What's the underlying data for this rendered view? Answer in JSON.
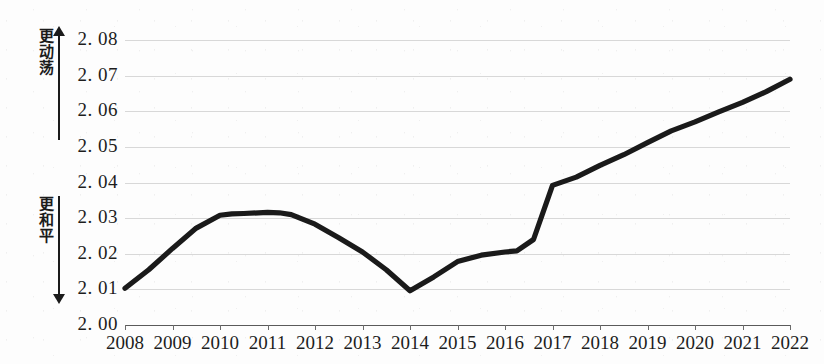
{
  "axes": {
    "y": {
      "direction_top_label": "更动荡",
      "direction_bottom_label": "更和平",
      "tick_labels": [
        "2. 08",
        "2. 07",
        "2. 06",
        "2. 05",
        "2. 04",
        "2. 03",
        "2. 02",
        "2. 01",
        "2. 00"
      ],
      "tick_values": [
        2.08,
        2.07,
        2.06,
        2.05,
        2.04,
        2.03,
        2.02,
        2.01,
        2.0
      ]
    },
    "x": {
      "tick_labels": [
        "2008",
        "2009",
        "2010",
        "2011",
        "2012",
        "2013",
        "2014",
        "2015",
        "2016",
        "2017",
        "2018",
        "2019",
        "2020",
        "2021",
        "2022"
      ]
    }
  },
  "style": {
    "series_color": "#1a1a1a",
    "grid_color": "#c9c9c9",
    "axis_color": "#5a5a5a",
    "background": "#fdfdfd"
  },
  "chart_data": {
    "type": "line",
    "title": "",
    "subtitle": "",
    "xlabel": "",
    "ylabel": "",
    "legend": [],
    "grid": true,
    "legend_position": "none",
    "xlim": [
      2008,
      2022
    ],
    "ylim": [
      2.0,
      2.08
    ],
    "yticks": [
      2.0,
      2.01,
      2.02,
      2.03,
      2.04,
      2.05,
      2.06,
      2.07,
      2.08
    ],
    "xticks": [
      2008,
      2009,
      2010,
      2011,
      2012,
      2013,
      2014,
      2015,
      2016,
      2017,
      2018,
      2019,
      2020,
      2021,
      2022
    ],
    "annotations": [
      {
        "text": "更动荡",
        "position": "y-axis-top",
        "meaning": "more turbulent / higher values"
      },
      {
        "text": "更和平",
        "position": "y-axis-bottom",
        "meaning": "more peaceful / lower values"
      }
    ],
    "series": [
      {
        "name": "",
        "x": [
          2008,
          2008.5,
          2009,
          2009.5,
          2010,
          2010.25,
          2010.5,
          2011,
          2011.25,
          2011.5,
          2012,
          2012.5,
          2013,
          2013.5,
          2014,
          2014.5,
          2015,
          2015.5,
          2016,
          2016.25,
          2016.6,
          2017,
          2017.5,
          2018,
          2018.5,
          2019,
          2019.5,
          2020,
          2020.5,
          2021,
          2021.5,
          2022
        ],
        "values": [
          2.0103,
          2.0155,
          2.0215,
          2.0272,
          2.0308,
          2.0312,
          2.0313,
          2.0316,
          2.0315,
          2.031,
          2.0283,
          2.0245,
          2.0205,
          2.0155,
          2.0096,
          2.0135,
          2.0178,
          2.0196,
          2.0205,
          2.0208,
          2.024,
          2.0392,
          2.0415,
          2.0448,
          2.0478,
          2.0512,
          2.0545,
          2.057,
          2.0598,
          2.0625,
          2.0655,
          2.069
        ]
      }
    ]
  }
}
